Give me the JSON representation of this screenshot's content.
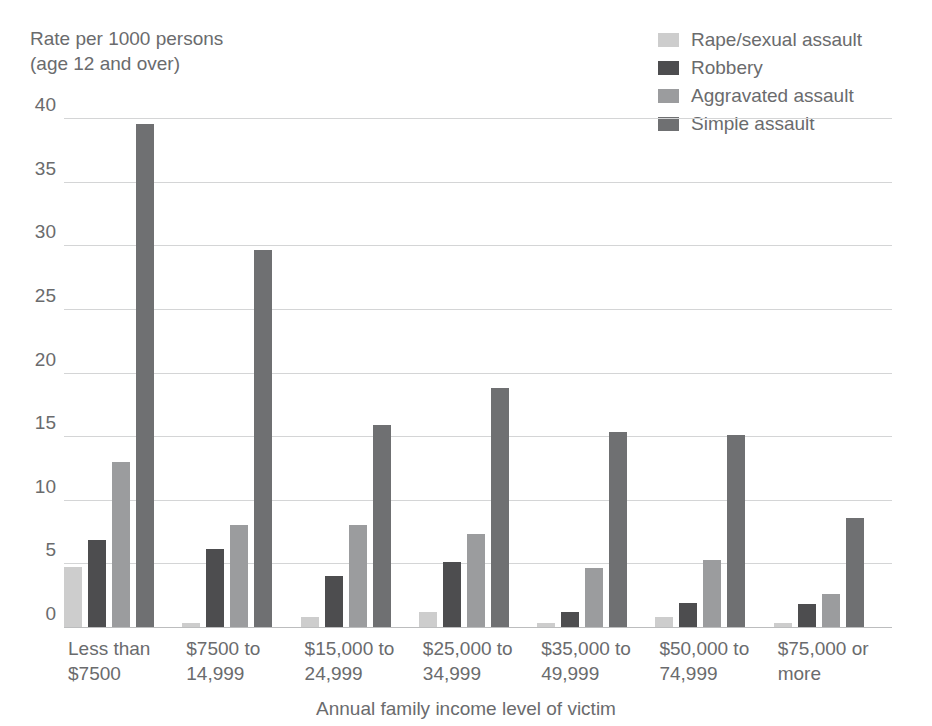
{
  "chart_data": {
    "type": "bar",
    "title": "",
    "ylabel": "Rate per 1000 persons\n(age 12 and over)",
    "xlabel": "Annual family income level of victim",
    "ylim": [
      0,
      40
    ],
    "ytick_step": 5,
    "yticks": [
      "40",
      "35",
      "30",
      "25",
      "20",
      "15",
      "10",
      "5",
      "0"
    ],
    "grid": true,
    "legend_position": "top-right",
    "categories": [
      "Less than\n$7500",
      "$7500 to\n14,999",
      "$15,000 to\n24,999",
      "$25,000 to\n34,999",
      "$35,000 to\n49,999",
      "$50,000 to\n74,999",
      "$75,000 or\nmore"
    ],
    "series": [
      {
        "name": "Rape/sexual assault",
        "color": "#cdcdcd",
        "values": [
          4.7,
          0.3,
          0.8,
          1.2,
          0.3,
          0.8,
          0.3
        ]
      },
      {
        "name": "Robbery",
        "color": "#4d4d4f",
        "values": [
          6.8,
          6.1,
          4.0,
          5.1,
          1.2,
          1.9,
          1.8
        ]
      },
      {
        "name": "Aggravated assault",
        "color": "#9b9c9e",
        "values": [
          13.0,
          8.0,
          8.0,
          7.3,
          4.6,
          5.3,
          2.6
        ]
      },
      {
        "name": "Simple assault",
        "color": "#6f7072",
        "values": [
          39.5,
          29.6,
          15.9,
          18.8,
          15.3,
          15.1,
          8.6
        ]
      }
    ]
  },
  "colors": {
    "text": "#6a6b6d",
    "gridline": "#d4d5d6",
    "baseline": "#bcbdbe",
    "background": "#ffffff"
  }
}
